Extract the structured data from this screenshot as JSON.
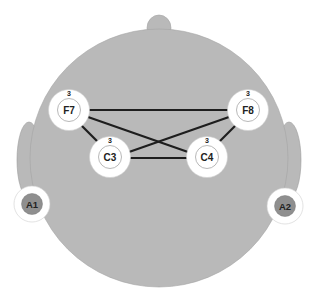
{
  "diagram": {
    "type": "eeg-electrode-connectivity",
    "colors": {
      "head": "#b9b9b9",
      "head_stroke": "#9a9a9a",
      "electrode_ring": "#ffffff",
      "electrode_inner_stroke": "#9a9a9a",
      "reference_fill": "#8f8f8f",
      "connection": "#1e1e1e"
    },
    "electrodes": [
      {
        "id": "F7",
        "label": "F7",
        "count": "3",
        "x": 69,
        "y": 110
      },
      {
        "id": "F8",
        "label": "F8",
        "count": "3",
        "x": 248,
        "y": 110
      },
      {
        "id": "C3",
        "label": "C3",
        "count": "3",
        "x": 110,
        "y": 157
      },
      {
        "id": "C4",
        "label": "C4",
        "count": "3",
        "x": 207,
        "y": 157
      }
    ],
    "references": [
      {
        "id": "A1",
        "label": "A1",
        "x": 32,
        "y": 204
      },
      {
        "id": "A2",
        "label": "A2",
        "x": 285,
        "y": 206
      }
    ],
    "connections": [
      {
        "from": "F7",
        "to": "F8"
      },
      {
        "from": "F7",
        "to": "C3"
      },
      {
        "from": "F7",
        "to": "C4"
      },
      {
        "from": "F8",
        "to": "C3"
      },
      {
        "from": "F8",
        "to": "C4"
      },
      {
        "from": "C3",
        "to": "C4"
      }
    ]
  }
}
